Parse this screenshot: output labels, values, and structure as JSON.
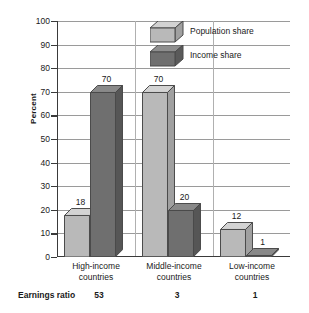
{
  "chart_data": {
    "type": "bar",
    "title": "",
    "subtitle": "",
    "xlabel": "",
    "ylabel": "Percent",
    "ylim": [
      0,
      100
    ],
    "ytick_step": 10,
    "yticks": [
      0,
      10,
      20,
      30,
      40,
      50,
      60,
      70,
      80,
      90,
      100
    ],
    "grid": true,
    "legend_position": "top-center",
    "style": "3d-grouped-bar",
    "categories": [
      "High-income countries",
      "Middle-income countries",
      "Low-income countries"
    ],
    "series": [
      {
        "name": "Population share",
        "color": "#b9b9b9",
        "values": [
          18,
          70,
          12
        ]
      },
      {
        "name": "Income share",
        "color": "#6f6f6f",
        "values": [
          70,
          20,
          1
        ]
      }
    ],
    "annotations": {
      "row_label": "Earnings ratio",
      "row_values": [
        "53",
        "3",
        "1"
      ]
    }
  },
  "axis": {
    "y_title": "Percent",
    "tick_labels": [
      "100",
      "90",
      "80",
      "70",
      "60",
      "50",
      "40",
      "30",
      "20",
      "10",
      "0"
    ]
  },
  "legend": {
    "items": [
      {
        "label": "Population share",
        "color": "#b9b9b9"
      },
      {
        "label": "Income share",
        "color": "#6f6f6f"
      }
    ]
  },
  "categories": [
    {
      "line1": "High-income",
      "line2": "countries"
    },
    {
      "line1": "Middle-income",
      "line2": "countries"
    },
    {
      "line1": "Low-income",
      "line2": "countries"
    }
  ],
  "bar_values": {
    "g0s0": "18",
    "g0s1": "70",
    "g1s0": "70",
    "g1s1": "20",
    "g2s0": "12",
    "g2s1": "1"
  },
  "ratio": {
    "label": "Earnings ratio",
    "v0": "53",
    "v1": "3",
    "v2": "1"
  },
  "colors": {
    "light_face": "#b9b9b9",
    "light_top": "#d2d2d2",
    "light_side": "#a0a0a0",
    "dark_face": "#6f6f6f",
    "dark_top": "#8e8e8e",
    "dark_side": "#5a5a5a",
    "axis": "#3a3a3a",
    "grid": "#9a9a9a"
  }
}
